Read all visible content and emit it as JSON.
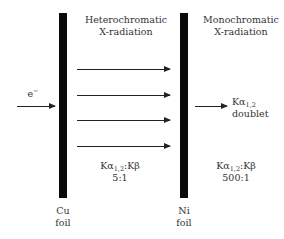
{
  "diagram": {
    "incident": {
      "label": "e",
      "superscript": "−"
    },
    "filters": [
      {
        "element": "Cu",
        "word": "foil"
      },
      {
        "element": "Ni",
        "word": "foil"
      }
    ],
    "regions": {
      "between": {
        "title_line1": "Heterochromatic",
        "title_line2": "X-radiation",
        "ratio_prefix": "Kα",
        "ratio_sub": "1,2",
        "ratio_suffix": ":Kβ",
        "ratio_value": "5:1"
      },
      "after": {
        "title_line1": "Monochromatic",
        "title_line2": "X-radiation",
        "ratio_prefix": "Kα",
        "ratio_sub": "1,2",
        "ratio_suffix": ":Kβ",
        "ratio_value": "500:1",
        "output_prefix": "Kα",
        "output_sub": "1,2",
        "output_word": "doublet"
      }
    },
    "arrow_count_between": 4
  }
}
